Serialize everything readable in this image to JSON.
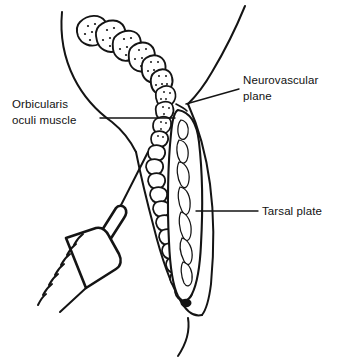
{
  "figure": {
    "background_color": "#ffffff",
    "ink_color": "#141414",
    "width": 350,
    "height": 358
  },
  "labels": [
    {
      "id": "orbicularis",
      "line1": "Orbicularis",
      "line2": "oculi muscle",
      "x": 12,
      "y": 108,
      "anchor": "start",
      "leader": "M 100 118 L 175 118"
    },
    {
      "id": "neurovascular",
      "line1": "Neurovascular",
      "line2": "plane",
      "x": 243,
      "y": 84,
      "anchor": "start",
      "leader": "M 239 89 L 186 104"
    },
    {
      "id": "tarsal",
      "line1": "Tarsal plate",
      "line2": "",
      "x": 262,
      "y": 215,
      "anchor": "start",
      "leader": "M 258 211 L 196 211"
    }
  ],
  "structures": [
    {
      "id": "skin-contour-anterior",
      "name": "anterior skin contour"
    },
    {
      "id": "skin-contour-posterior",
      "name": "posterior skin contour"
    },
    {
      "id": "orbicularis-bundles",
      "name": "orbicularis oculi muscle bundles"
    },
    {
      "id": "tarsal-plate",
      "name": "tarsal plate"
    },
    {
      "id": "meibomian-glands",
      "name": "meibomian glands"
    },
    {
      "id": "lid-margin-orifice",
      "name": "lid margin gland orifice"
    },
    {
      "id": "neurovascular-plane",
      "name": "neurovascular plane"
    },
    {
      "id": "syringe",
      "name": "syringe with needle"
    }
  ],
  "syringe": {
    "id": "syringe",
    "graduation_count": 7,
    "needle_tip_x": 148,
    "needle_tip_y": 152
  }
}
